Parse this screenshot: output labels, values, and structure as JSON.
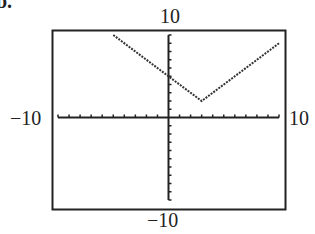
{
  "part_label": "b.",
  "window": {
    "xmin": "-10",
    "xmax": "10",
    "ymin": "-10",
    "ymax": "10"
  },
  "labels": {
    "top": "10",
    "bottom": "−10",
    "left": "−10",
    "right": "10"
  },
  "colors": {
    "frame": "#222222",
    "curve": "#333333",
    "axis": "#222222"
  },
  "chart_data": {
    "type": "line",
    "title": "",
    "function": "y = |x - 3| + 2",
    "xlabel": "",
    "ylabel": "",
    "xlim": [
      -10,
      10
    ],
    "ylim": [
      -10,
      10
    ],
    "xscale_ticks": 1,
    "yscale_ticks": 1,
    "grid": false,
    "series": [
      {
        "name": "y = |x - 3| + 2",
        "x": [
          -5,
          0,
          3,
          10
        ],
        "y": [
          10,
          5,
          2,
          9
        ]
      }
    ],
    "vertex": [
      3,
      2
    ],
    "y_intercept": 5,
    "window_labels": {
      "xmin": -10,
      "xmax": 10,
      "ymin": -10,
      "ymax": 10
    }
  }
}
